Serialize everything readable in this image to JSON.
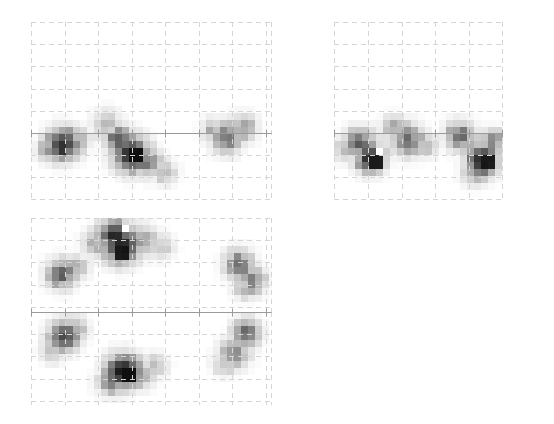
{
  "figure": {
    "width": 554,
    "height": 424,
    "background": "#ffffff",
    "title": ""
  },
  "style": {
    "grid_color": "#d5d5d5",
    "grid_dash": "5,4",
    "grid_width": 1,
    "axis_color": "#9a9a9a",
    "axis_width": 1,
    "tick_color": "#9a9a9a",
    "tick_length": 4,
    "blob_dark": "#101010",
    "blob_mid": "#6e6e6e",
    "blob_light": "#c4c4c4",
    "blob_highlight": "#ffffff",
    "pixel_size": 7
  },
  "chart_data": {
    "type": "heatmap",
    "title": "",
    "subtitle": "",
    "xlabel": "",
    "ylabel": "",
    "legend": [],
    "grid": true,
    "colormap": "grayscale-inverted",
    "value_range": [
      0,
      1
    ],
    "panels": [
      {
        "name": "panel-top-left",
        "x": 31,
        "y": 22,
        "width": 241,
        "height": 178,
        "grid_cols": 8,
        "grid_rows": 8,
        "cell_w": 33.5,
        "cell_h": 22.2,
        "axis_line_y": 111,
        "axis_ticks_x": [
          0,
          33.5,
          67,
          100.5,
          134,
          167.5,
          201,
          234.5
        ],
        "blobs": [
          {
            "cx": 32,
            "cy": 122,
            "r": 17,
            "peak": 0.82,
            "core_w": 10,
            "core_h": 12
          },
          {
            "cx": 17,
            "cy": 128,
            "r": 12,
            "peak": 0.42
          },
          {
            "cx": 48,
            "cy": 118,
            "r": 12,
            "peak": 0.34
          },
          {
            "cx": 88,
            "cy": 118,
            "r": 14,
            "peak": 0.55,
            "core_w": 8,
            "core_h": 10
          },
          {
            "cx": 100,
            "cy": 132,
            "r": 18,
            "peak": 0.96,
            "core_w": 12,
            "core_h": 13
          },
          {
            "cx": 116,
            "cy": 140,
            "r": 15,
            "peak": 0.48
          },
          {
            "cx": 133,
            "cy": 150,
            "r": 13,
            "peak": 0.3
          },
          {
            "cx": 76,
            "cy": 104,
            "r": 16,
            "peak": 0.3
          },
          {
            "cx": 196,
            "cy": 116,
            "r": 16,
            "peak": 0.52,
            "core_w": 8,
            "core_h": 9
          },
          {
            "cx": 212,
            "cy": 106,
            "r": 14,
            "peak": 0.44
          },
          {
            "cx": 182,
            "cy": 108,
            "r": 12,
            "peak": 0.32
          }
        ]
      },
      {
        "name": "panel-top-right",
        "x": 334,
        "y": 22,
        "width": 169,
        "height": 178,
        "grid_cols": 5,
        "grid_rows": 8,
        "cell_w": 33.8,
        "cell_h": 22.2,
        "axis_line_y": 111,
        "axis_ticks_x": [
          0,
          33.8,
          67.6,
          101.4,
          135.2,
          169
        ],
        "blobs": [
          {
            "cx": 26,
            "cy": 120,
            "r": 15,
            "peak": 0.58,
            "core_w": 9,
            "core_h": 9
          },
          {
            "cx": 36,
            "cy": 136,
            "r": 15,
            "peak": 0.95,
            "core_w": 11,
            "core_h": 12
          },
          {
            "cx": 44,
            "cy": 126,
            "r": 8,
            "peak": 0.02,
            "highlight": true
          },
          {
            "cx": 12,
            "cy": 128,
            "r": 13,
            "peak": 0.34
          },
          {
            "cx": 74,
            "cy": 118,
            "r": 16,
            "peak": 0.6,
            "core_w": 9,
            "core_h": 9
          },
          {
            "cx": 60,
            "cy": 106,
            "r": 13,
            "peak": 0.36
          },
          {
            "cx": 92,
            "cy": 124,
            "r": 12,
            "peak": 0.3
          },
          {
            "cx": 126,
            "cy": 114,
            "r": 15,
            "peak": 0.62,
            "core_w": 9,
            "core_h": 9
          },
          {
            "cx": 148,
            "cy": 138,
            "r": 16,
            "peak": 0.93,
            "core_w": 11,
            "core_h": 12
          },
          {
            "cx": 158,
            "cy": 120,
            "r": 13,
            "peak": 0.5,
            "core_w": 8,
            "core_h": 8
          },
          {
            "cx": 140,
            "cy": 152,
            "r": 13,
            "peak": 0.34
          }
        ]
      },
      {
        "name": "panel-mid-left",
        "x": 31,
        "y": 218,
        "width": 241,
        "height": 94,
        "grid_cols": 8,
        "grid_rows": 4,
        "cell_w": 33.5,
        "cell_h": 22.2,
        "axis_line_y": 94,
        "axis_ticks_x": [
          0,
          33.5,
          67,
          100.5,
          134,
          167.5,
          201,
          234.5
        ],
        "blobs": [
          {
            "cx": 83,
            "cy": 16,
            "r": 16,
            "peak": 0.68,
            "core_w": 9,
            "core_h": 9
          },
          {
            "cx": 94,
            "cy": 11,
            "r": 9,
            "peak": 0.02,
            "highlight": true
          },
          {
            "cx": 90,
            "cy": 28,
            "r": 18,
            "peak": 0.95,
            "core_w": 13,
            "core_h": 12
          },
          {
            "cx": 110,
            "cy": 22,
            "r": 16,
            "peak": 0.4
          },
          {
            "cx": 66,
            "cy": 24,
            "r": 14,
            "peak": 0.38
          },
          {
            "cx": 130,
            "cy": 28,
            "r": 14,
            "peak": 0.24
          },
          {
            "cx": 30,
            "cy": 56,
            "r": 15,
            "peak": 0.66,
            "core_w": 9,
            "core_h": 9
          },
          {
            "cx": 45,
            "cy": 50,
            "r": 13,
            "peak": 0.36
          },
          {
            "cx": 208,
            "cy": 46,
            "r": 15,
            "peak": 0.58,
            "core_w": 9,
            "core_h": 8
          },
          {
            "cx": 222,
            "cy": 62,
            "r": 14,
            "peak": 0.5,
            "core_w": 8,
            "core_h": 8
          },
          {
            "cx": 214,
            "cy": 70,
            "r": 12,
            "peak": 0.32
          }
        ]
      },
      {
        "name": "panel-bottom-left",
        "x": 31,
        "y": 312,
        "width": 241,
        "height": 93,
        "grid_cols": 8,
        "grid_rows": 4,
        "cell_w": 33.5,
        "cell_h": 22.2,
        "axis_line_y": 0,
        "axis_ticks_x": [
          0,
          33.5,
          67,
          100.5,
          134,
          167.5,
          201,
          234.5
        ],
        "blobs": [
          {
            "cx": 33,
            "cy": 24,
            "r": 16,
            "peak": 0.72,
            "core_w": 9,
            "core_h": 10
          },
          {
            "cx": 22,
            "cy": 38,
            "r": 13,
            "peak": 0.3
          },
          {
            "cx": 46,
            "cy": 16,
            "r": 12,
            "peak": 0.34
          },
          {
            "cx": 92,
            "cy": 58,
            "r": 17,
            "peak": 0.95,
            "core_w": 11,
            "core_h": 11
          },
          {
            "cx": 80,
            "cy": 70,
            "r": 14,
            "peak": 0.52,
            "core_w": 8,
            "core_h": 8
          },
          {
            "cx": 108,
            "cy": 64,
            "r": 14,
            "peak": 0.4
          },
          {
            "cx": 124,
            "cy": 54,
            "r": 13,
            "peak": 0.26
          },
          {
            "cx": 216,
            "cy": 20,
            "r": 14,
            "peak": 0.62,
            "core_w": 9,
            "core_h": 8
          },
          {
            "cx": 204,
            "cy": 40,
            "r": 16,
            "peak": 0.42
          },
          {
            "cx": 194,
            "cy": 52,
            "r": 13,
            "peak": 0.28
          }
        ]
      }
    ]
  }
}
